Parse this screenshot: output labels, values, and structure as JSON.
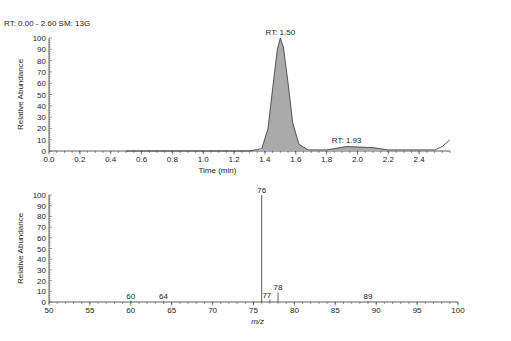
{
  "header": "RT: 0.00 - 2.60 SM: 13G",
  "chart_data": [
    {
      "type": "line",
      "title": "RT: 0.00 - 2.60 SM: 13G",
      "xlabel": "Time (min)",
      "ylabel": "Relative Abundance",
      "xlim": [
        0.0,
        2.6
      ],
      "ylim": [
        0,
        100
      ],
      "xticks": [
        0.0,
        0.2,
        0.4,
        0.6,
        0.8,
        1.0,
        1.2,
        1.4,
        1.6,
        1.8,
        2.0,
        2.2,
        2.4
      ],
      "yticks": [
        0,
        10,
        20,
        30,
        40,
        50,
        60,
        70,
        80,
        90,
        100
      ],
      "annotations": [
        {
          "label": "RT: 1.50",
          "x": 1.5,
          "y": 100
        },
        {
          "label": "RT: 1.93",
          "x": 1.93,
          "y": 4
        }
      ],
      "x": [
        0.5,
        1.3,
        1.38,
        1.42,
        1.45,
        1.48,
        1.5,
        1.52,
        1.55,
        1.58,
        1.62,
        1.68,
        1.8,
        1.93,
        2.1,
        2.2,
        2.5,
        2.55,
        2.6
      ],
      "y": [
        0,
        0,
        2,
        20,
        55,
        90,
        100,
        92,
        60,
        25,
        6,
        1,
        1,
        4,
        3,
        1,
        1,
        4,
        10
      ]
    },
    {
      "type": "bar",
      "xlabel": "m/z",
      "ylabel": "Relative Abundance",
      "xlim": [
        50,
        100
      ],
      "ylim": [
        0,
        100
      ],
      "xticks": [
        50,
        55,
        60,
        65,
        70,
        75,
        80,
        85,
        90,
        95,
        100
      ],
      "yticks": [
        0,
        10,
        20,
        30,
        40,
        50,
        60,
        70,
        80,
        90,
        100
      ],
      "peaks": [
        {
          "mz": 60,
          "intensity": 1
        },
        {
          "mz": 64,
          "intensity": 1
        },
        {
          "mz": 76,
          "intensity": 100
        },
        {
          "mz": 77,
          "intensity": 2
        },
        {
          "mz": 78,
          "intensity": 9
        },
        {
          "mz": 89,
          "intensity": 1
        }
      ]
    }
  ]
}
